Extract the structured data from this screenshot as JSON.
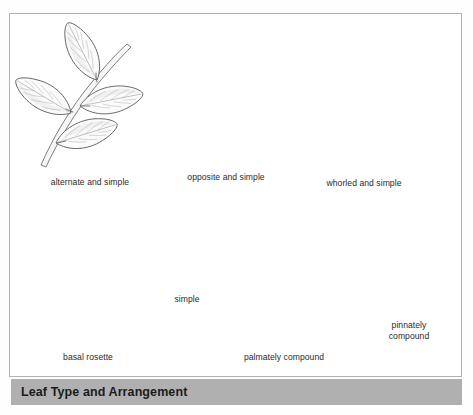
{
  "figure": {
    "caption": "Leaf Type and Arrangement",
    "border_color": "#b2b2b2",
    "caption_bar_color": "#b0b0b0",
    "caption_text_color": "#1b1b1b",
    "ink_color": "#5e5e5e",
    "background_color": "#ffffff"
  },
  "labels": {
    "alternate_and_simple": "alternate and simple",
    "opposite_and_simple": "opposite and simple",
    "whorled_and_simple": "whorled and simple",
    "basal_rosette": "basal rosette",
    "simple": "simple",
    "palmately_compound": "palmately compound",
    "pinnately_compound_line1": "pinnately",
    "pinnately_compound_line2": "compound"
  },
  "specimens": [
    {
      "name": "alternate-and-simple",
      "label": "alternate and simple",
      "arrangement": "alternate",
      "leaf_type": "simple",
      "leaf_count": 4,
      "description": "Leaves borne singly at staggered nodes along an ascending stem"
    },
    {
      "name": "opposite-and-simple",
      "label": "opposite and simple",
      "arrangement": "opposite",
      "leaf_type": "simple",
      "leaf_count": 4,
      "description": "Leaves borne in pairs directly across from one another at each node"
    },
    {
      "name": "whorled-and-simple",
      "label": "whorled and simple",
      "arrangement": "whorled",
      "leaf_type": "simple",
      "leaf_count": 4,
      "description": "Four leaves radiating from a single node around the stem"
    },
    {
      "name": "basal-rosette",
      "label": "basal rosette",
      "arrangement": "basal rosette",
      "leaf_type": "simple",
      "leaf_count": 9,
      "description": "Leaves radiating in a circular cluster at ground level above fibrous roots"
    },
    {
      "name": "simple-leaf",
      "label": "simple",
      "arrangement": "single",
      "leaf_type": "simple",
      "leaf_count": 1,
      "description": "One undivided blade attached to the twig by a short petiole"
    },
    {
      "name": "palmately-compound",
      "label": "palmately compound",
      "arrangement": "opposite",
      "leaf_type": "palmately compound",
      "leaflet_count": 5,
      "description": "Five leaflets radiating from a common point at the petiole tip"
    },
    {
      "name": "pinnately-compound",
      "label": "pinnately compound",
      "arrangement": "alternate",
      "leaf_type": "pinnately compound",
      "leaflet_count": 13,
      "description": "Leaflets arranged in pairs along a central rachis with a terminal leaflet"
    }
  ]
}
